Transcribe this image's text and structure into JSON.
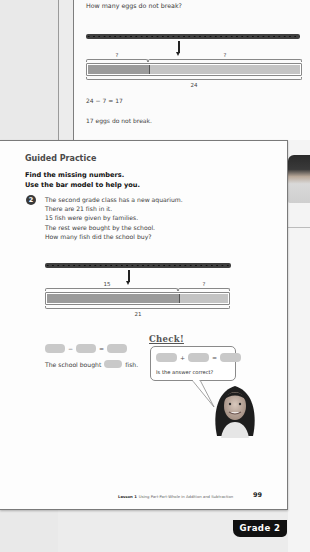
{
  "back_page": {
    "question": "How many eggs do not break?",
    "bar_model": {
      "top_labels": [
        "?",
        "?"
      ],
      "bottom_label": "24",
      "dark_fraction": 0.29
    },
    "equation": "24 − 7 = 17",
    "answer": "17 eggs do not break."
  },
  "front_page": {
    "section_title": "Guided Practice",
    "instructions": [
      "Find the missing numbers.",
      "Use the bar model to help you."
    ],
    "question_number": "2",
    "question_lines": [
      "The second grade class has a new aquarium.",
      "There are 21 fish in it.",
      "15 fish were given by families.",
      "The rest were bought by the school.",
      "How many fish did the school buy?"
    ],
    "bar_model": {
      "top_labels": [
        "15",
        "?"
      ],
      "bottom_label": "21",
      "dark_fraction": 0.714
    },
    "equation_ops": [
      "−",
      "="
    ],
    "sentence_start": "The school bought",
    "sentence_end": "fish.",
    "check": {
      "title": "Check!",
      "equation_ops": [
        "+",
        "="
      ],
      "question": "Is the answer correct?"
    },
    "footer": {
      "lesson": "Lesson 1",
      "lesson_title": "Using Part-Part-Whole in Addition and Subtraction",
      "page_number": "99"
    }
  },
  "grade_tab": "Grade 2",
  "colors": {
    "bar_dark": "#9b9b9b",
    "bar_light": "#c4c4c4",
    "blank_box": "#c9c9c9",
    "tab_bg": "#111111"
  }
}
